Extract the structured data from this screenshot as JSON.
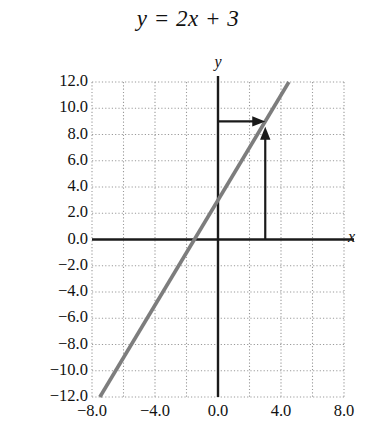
{
  "chart_data": {
    "type": "line",
    "title": "y = 2x + 3",
    "xlabel": "x",
    "ylabel": "y",
    "equation": "y = 2x + 3",
    "slope": 2,
    "intercept": 3,
    "xlim": [
      -8.0,
      8.0
    ],
    "ylim": [
      -12.0,
      12.0
    ],
    "xticks": [
      "-8.0",
      "-4.0",
      "0.0",
      "4.0",
      "8.0"
    ],
    "xtick_values": [
      -8.0,
      -4.0,
      0.0,
      4.0,
      8.0
    ],
    "yticks": [
      "12.0",
      "10.0",
      "8.0",
      "6.0",
      "4.0",
      "2.0",
      "0.0",
      "-2.0",
      "-4.0",
      "-6.0",
      "-8.0",
      "-10.0",
      "-12.0"
    ],
    "ytick_values": [
      12.0,
      10.0,
      8.0,
      6.0,
      4.0,
      2.0,
      0.0,
      -2.0,
      -4.0,
      -6.0,
      -8.0,
      -10.0,
      -12.0
    ],
    "grid": true,
    "grid_style": "dotted",
    "grid_spacing_x": 2.0,
    "grid_spacing_y": 2.0,
    "legend": null,
    "series": [
      {
        "name": "y = 2x + 3",
        "color": "#7d7d7d",
        "points": [
          [
            -7.5,
            -12.0
          ],
          [
            4.5,
            12.0
          ]
        ]
      }
    ],
    "annotations": [
      {
        "name": "horizontal-arrow",
        "kind": "arrow",
        "from": [
          0.0,
          9.0
        ],
        "to": [
          3.0,
          9.0
        ],
        "color": "#1a1a1a"
      },
      {
        "name": "vertical-arrow",
        "kind": "arrow",
        "from": [
          3.0,
          0.0
        ],
        "to": [
          3.0,
          8.6
        ],
        "color": "#1a1a1a"
      }
    ],
    "axis_color": "#1a1a1a",
    "grid_color": "#9a9a9a",
    "background": "#ffffff"
  }
}
